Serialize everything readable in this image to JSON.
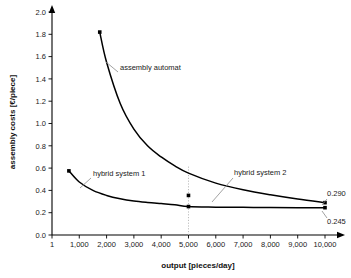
{
  "chart_data": {
    "type": "line",
    "title": "",
    "xlabel": "output [pieces/day]",
    "ylabel": "assembly costs [€/piece]",
    "xlim": [
      1,
      10000
    ],
    "ylim": [
      0.0,
      2.0
    ],
    "grid": false,
    "legend_position": "inline-annotations",
    "xticks": [
      1,
      1000,
      2000,
      3000,
      4000,
      5000,
      6000,
      7000,
      8000,
      9000,
      10000
    ],
    "xticklabels": [
      "1",
      "1,000",
      "2,000",
      "3,000",
      "4,000",
      "5,000",
      "6,000",
      "7,000",
      "8,000",
      "9,000",
      "10,000"
    ],
    "yticks": [
      0.0,
      0.2,
      0.4,
      0.6,
      0.8,
      1.0,
      1.2,
      1.4,
      1.6,
      1.8,
      2.0
    ],
    "yticklabels": [
      "0.0",
      "0.2",
      "0.4",
      "0.6",
      "0.8",
      "1.0",
      "1.2",
      "1.4",
      "1.6",
      "1.8",
      "2.0"
    ],
    "series": [
      {
        "name": "assembly automat",
        "x": [
          1750,
          2000,
          2500,
          3000,
          3500,
          4000,
          4500,
          5000,
          6000,
          7000,
          8000,
          9000,
          10000
        ],
        "y": [
          1.82,
          1.55,
          1.18,
          0.95,
          0.8,
          0.7,
          0.62,
          0.555,
          0.465,
          0.405,
          0.36,
          0.322,
          0.29
        ],
        "markers": [
          {
            "x": 1750,
            "y": 1.82
          },
          {
            "x": 5000,
            "y": 0.355
          },
          {
            "x": 10000,
            "y": 0.29
          }
        ],
        "end_value_label": "0.290"
      },
      {
        "name": "hybrid system 1",
        "x": [
          620,
          1000,
          1500,
          2000,
          2500,
          3000,
          3500,
          4000,
          4500,
          5000,
          6000,
          7000,
          8000,
          9000,
          10000
        ],
        "y": [
          0.575,
          0.475,
          0.4,
          0.355,
          0.325,
          0.305,
          0.292,
          0.282,
          0.272,
          0.255,
          0.25,
          0.248,
          0.246,
          0.245,
          0.245
        ],
        "markers": [
          {
            "x": 620,
            "y": 0.575
          },
          {
            "x": 5000,
            "y": 0.255
          },
          {
            "x": 10000,
            "y": 0.245
          }
        ],
        "end_value_label": "0.245"
      }
    ],
    "annotations": [
      {
        "text": "assembly automat",
        "x": 120,
        "y": 70
      },
      {
        "text": "hybrid system 1",
        "x": 93,
        "y": 176
      },
      {
        "text": "hybrid system 2",
        "x": 234,
        "y": 175
      }
    ],
    "reference_line": {
      "x": 5000,
      "style": "dotted",
      "from_y": 0.0,
      "to_y": 0.62
    },
    "value_labels": [
      {
        "text": "0.290",
        "x": 327,
        "y": 196
      },
      {
        "text": "0.245",
        "x": 327,
        "y": 224
      }
    ]
  }
}
